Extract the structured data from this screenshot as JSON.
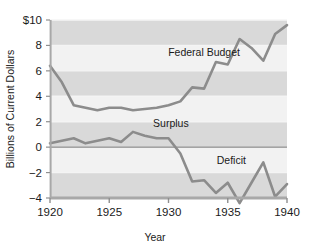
{
  "chart_data": {
    "type": "line",
    "title": "",
    "subtitle": "",
    "xlabel": "Year",
    "ylabel": "Billions of Current Dollars",
    "xlim": [
      1920,
      1940
    ],
    "ylim": [
      -4,
      10
    ],
    "xticks": [
      1920,
      1925,
      1930,
      1935,
      1940
    ],
    "xtick_labels": [
      "1920",
      "1925",
      "1930",
      "1935",
      "1940"
    ],
    "yticks": [
      -4,
      -2,
      0,
      2,
      4,
      6,
      8,
      10
    ],
    "ytick_labels": [
      "−4",
      "−2",
      "0",
      "2",
      "4",
      "6",
      "8",
      "$10"
    ],
    "grid": true,
    "grid_style": "alternating horizontal bands",
    "legend_position": "inline annotations",
    "x": [
      1920,
      1921,
      1922,
      1923,
      1924,
      1925,
      1926,
      1927,
      1928,
      1929,
      1930,
      1931,
      1932,
      1933,
      1934,
      1935,
      1936,
      1937,
      1938,
      1939,
      1940
    ],
    "series": [
      {
        "name": "Federal Budget",
        "color": "#8c8c8c",
        "values": [
          6.4,
          5.1,
          3.3,
          3.1,
          2.9,
          3.1,
          3.1,
          2.9,
          3.0,
          3.1,
          3.3,
          3.6,
          4.7,
          4.6,
          6.7,
          6.5,
          8.5,
          7.8,
          6.8,
          8.9,
          9.6
        ]
      },
      {
        "name": "Surplus or Deficit",
        "color": "#8c8c8c",
        "values": [
          0.3,
          0.5,
          0.7,
          0.3,
          0.5,
          0.7,
          0.4,
          1.2,
          0.9,
          0.7,
          0.7,
          -0.5,
          -2.7,
          -2.6,
          -3.6,
          -2.8,
          -4.4,
          -2.8,
          -1.2,
          -3.9,
          -2.9
        ]
      }
    ],
    "annotations": [
      {
        "text": "Federal Budget",
        "x": 1933.0,
        "y": 7.2
      },
      {
        "text": "Surplus",
        "x": 1930.2,
        "y": 1.6
      },
      {
        "text": "Deficit",
        "x": 1935.3,
        "y": -1.3
      }
    ],
    "colors": {
      "plot_background": "#d4d4d4",
      "band_light": "#d9d9d9",
      "band_white": "#f2f2f2",
      "line": "#8c8c8c",
      "zero_line": "#8a8a8a",
      "axis": "#9e9e9e",
      "text": "#1a1a1a",
      "page_background": "#ffffff"
    }
  },
  "axes": {
    "y_title": "Billions of Current Dollars",
    "x_title": "Year"
  }
}
